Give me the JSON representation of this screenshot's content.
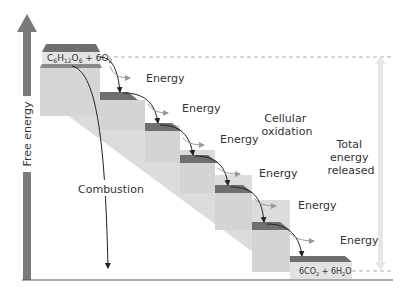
{
  "diagram": {
    "type": "energy-staircase",
    "y_axis_label": "Free energy",
    "start_compound": {
      "c": "C",
      "c_sub": "6",
      "h": "H",
      "h_sub": "12",
      "o": "O",
      "o_sub": "6",
      "plus": " + 6O",
      "o2_sub": "2"
    },
    "end_compound": {
      "part1": "6CO",
      "part1_sub": "2",
      "part2": " + 6H",
      "part2_sub": "2",
      "part3": "O"
    },
    "energy_labels": [
      "Energy",
      "Energy",
      "Energy",
      "Energy",
      "Energy",
      "Energy"
    ],
    "combustion_label": "Combustion",
    "cellular_oxidation_label": [
      "Cellular",
      "oxidation"
    ],
    "total_energy_label": [
      "Total",
      "energy",
      "released"
    ],
    "colors": {
      "axis": "#7a7a7a",
      "step_top": "#6f6f6f",
      "step_body": "#d4d4d4",
      "step_face": "#e2e2e2",
      "total_arrow": "#e6e6e6",
      "dashed": "#888888",
      "text": "#333333",
      "arrow": "#222222"
    }
  }
}
